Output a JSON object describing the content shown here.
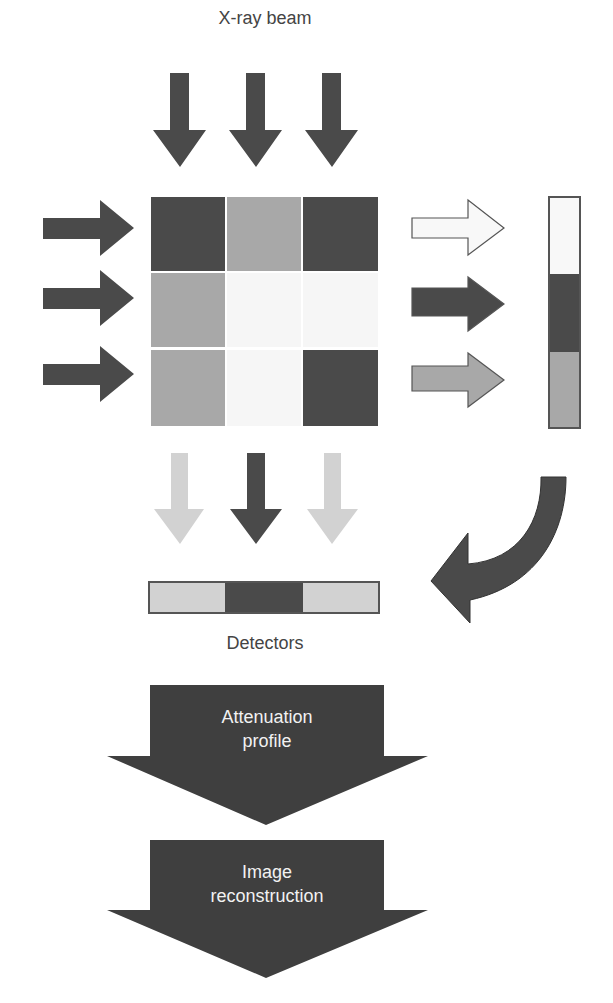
{
  "labels": {
    "beam": "X-ray beam",
    "detectors": "Detectors",
    "step1_line1": "Attenuation",
    "step1_line2": "profile",
    "step2_line1": "Image",
    "step2_line2": "reconstruction"
  },
  "colors": {
    "dark": "#4a4a4a",
    "medium": "#a8a8a8",
    "light": "#d2d2d2",
    "white": "#f6f6f6",
    "outline": "#555555"
  },
  "grid": {
    "rows": [
      [
        "dark",
        "medium",
        "dark"
      ],
      [
        "medium",
        "white",
        "white"
      ],
      [
        "medium",
        "white",
        "dark"
      ]
    ]
  },
  "row_profile": [
    "white",
    "dark",
    "medium"
  ],
  "column_profile": [
    "light",
    "dark",
    "light"
  ]
}
